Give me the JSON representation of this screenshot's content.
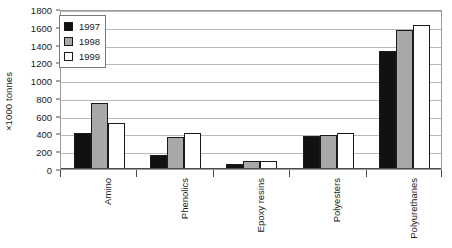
{
  "chart_data": {
    "type": "bar",
    "title": "",
    "subtitle": "",
    "xlabel": "",
    "ylabel": "×1000 tonnes",
    "ylim": [
      0,
      1800
    ],
    "ytick_step": 200,
    "yticks": [
      0,
      200,
      400,
      600,
      800,
      1000,
      1200,
      1400,
      1600,
      1800
    ],
    "ytick_labels": [
      "0",
      "200",
      "400",
      "600",
      "800",
      "1000",
      "1200",
      "1400",
      "1600",
      "1800"
    ],
    "grid": "horizontal",
    "legend_position": "top-left-inside",
    "categories": [
      "Amino",
      "Phenolics",
      "Epoxy resins",
      "Polyesters",
      "Polyurethanes"
    ],
    "series": [
      {
        "name": "1997",
        "color": "#111111",
        "values": [
          400,
          160,
          60,
          370,
          1330
        ]
      },
      {
        "name": "1998",
        "color": "#a8a8a8",
        "values": [
          745,
          360,
          90,
          380,
          1560
        ]
      },
      {
        "name": "1999",
        "color": "#ffffff",
        "values": [
          520,
          400,
          95,
          400,
          1620
        ]
      }
    ],
    "annotations": []
  },
  "legend": {
    "items": [
      {
        "label": "1997",
        "swatch_name": "legend-swatch-1997"
      },
      {
        "label": "1998",
        "swatch_name": "legend-swatch-1998"
      },
      {
        "label": "1999",
        "swatch_name": "legend-swatch-1999"
      }
    ]
  },
  "colors": {
    "series_1997": "#111111",
    "series_1998": "#a8a8a8",
    "series_1999": "#ffffff",
    "bar_outline": "#1a1a1a",
    "gridline": "#b8b8b8",
    "axis": "#4d4d4d",
    "plot_border": "#9a9a9a",
    "text": "#1a1a1a",
    "background": "#ffffff"
  }
}
